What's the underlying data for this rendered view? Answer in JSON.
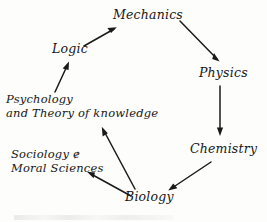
{
  "diagram": {
    "ink_color": "#1a1a18",
    "background_color": "#fdfdfc",
    "style": "handwritten-italic",
    "nodes": [
      {
        "id": "mechanics",
        "label": "Mechanics",
        "lines": [
          "Mechanics"
        ]
      },
      {
        "id": "physics",
        "label": "Physics",
        "lines": [
          "Physics"
        ]
      },
      {
        "id": "chemistry",
        "label": "Chemistry",
        "lines": [
          "Chemistry"
        ]
      },
      {
        "id": "biology",
        "label": "Biology",
        "lines": [
          "Biology"
        ]
      },
      {
        "id": "sociology",
        "label": "Sociology & Moral Sciences",
        "lines": [
          "Sociology ɇ",
          "Moral Sciences"
        ]
      },
      {
        "id": "psychology",
        "label": "Psychology and Theory of knowledge",
        "lines": [
          "Psychology",
          "and Theory of knowledge"
        ]
      },
      {
        "id": "logic",
        "label": "Logic",
        "lines": [
          "Logic"
        ]
      }
    ],
    "edges": [
      {
        "id": "logic-to-mechanics",
        "from": "Logic",
        "to": "Mechanics",
        "direction": "up-right"
      },
      {
        "id": "mechanics-to-physics",
        "from": "Mechanics",
        "to": "Physics",
        "direction": "down-right"
      },
      {
        "id": "physics-to-chemistry",
        "from": "Physics",
        "to": "Chemistry",
        "direction": "down"
      },
      {
        "id": "chemistry-to-biology",
        "from": "Chemistry",
        "to": "Biology",
        "direction": "down-left"
      },
      {
        "id": "biology-to-sociology",
        "from": "Biology",
        "to": "Sociology & Moral Sciences",
        "direction": "up-left"
      },
      {
        "id": "biology-to-psychology",
        "from": "Biology",
        "to": "Psychology and Theory of knowledge",
        "direction": "up-left"
      },
      {
        "id": "psychology-to-logic",
        "from": "Psychology and Theory of knowledge",
        "to": "Logic",
        "direction": "up"
      }
    ]
  }
}
